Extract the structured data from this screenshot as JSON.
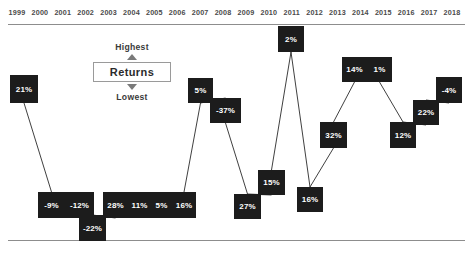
{
  "legend": {
    "highest_label": "Highest",
    "lowest_label": "Lowest",
    "box_label": "Returns",
    "up_arrow": "triangle-up-icon",
    "down_arrow": "triangle-down-icon"
  },
  "chart_data": {
    "type": "line",
    "title": "",
    "subtitle": "",
    "xlabel": "",
    "ylabel": "Returns",
    "grid": false,
    "legend_position": "top-left-inset",
    "axis": {
      "x_tick_labels": [
        "1999",
        "2000",
        "2001",
        "2002",
        "2003",
        "2004",
        "2005",
        "2006",
        "2007",
        "2008",
        "2009",
        "2010",
        "2011",
        "2012",
        "2013",
        "2014",
        "2015",
        "2016",
        "2017",
        "2018"
      ],
      "y_axis_described": "Highest to Lowest",
      "top_rule": true,
      "bottom_rule": true
    },
    "categories": [
      "1999",
      "2000",
      "2001",
      "2002",
      "2003",
      "2004",
      "2005",
      "2006",
      "2007",
      "2008",
      "2009",
      "2010",
      "2011",
      "2012",
      "2013",
      "2014",
      "2015",
      "2016",
      "2017",
      "2018"
    ],
    "values": [
      21,
      -9,
      -12,
      -22,
      28,
      11,
      5,
      16,
      5,
      -37,
      27,
      15,
      2,
      16,
      32,
      14,
      1,
      12,
      22,
      -4
    ],
    "point_labels": [
      "21%",
      "-9%",
      "-12%",
      "-22%",
      "28%",
      "11%",
      "5%",
      "16%",
      "5%",
      "-37%",
      "27%",
      "15%",
      "2%",
      "16%",
      "32%",
      "14%",
      "1%",
      "12%",
      "22%",
      "-4%"
    ],
    "colors": {
      "node_fill": "#1c1c1c",
      "node_text": "#ffffff",
      "connector": "#2a2a2a",
      "rule": "#8d8d8d",
      "year_label": "#4a4a4a"
    }
  },
  "nodes": [
    {
      "year": "1999",
      "label": "21%",
      "x": 10,
      "y": 75,
      "w": 28,
      "h": 28,
      "group": null
    },
    {
      "year": "2000",
      "label": "-9%",
      "x": 38,
      "y": 192,
      "w": 27,
      "h": 26,
      "group": "g2000_2001"
    },
    {
      "year": "2001",
      "label": "-12%",
      "x": 65,
      "y": 192,
      "w": 29,
      "h": 26,
      "group": "g2000_2001"
    },
    {
      "year": "2002",
      "label": "-22%",
      "x": 79,
      "y": 215,
      "w": 27,
      "h": 26,
      "group": null
    },
    {
      "year": "2003",
      "label": "28%",
      "x": 103,
      "y": 192,
      "w": 25,
      "h": 26,
      "group": "g2003_2006"
    },
    {
      "year": "2004",
      "label": "11%",
      "x": 128,
      "y": 192,
      "w": 23,
      "h": 26,
      "group": "g2003_2006"
    },
    {
      "year": "2005",
      "label": "5%",
      "x": 151,
      "y": 192,
      "w": 21,
      "h": 26,
      "group": "g2003_2006"
    },
    {
      "year": "2006",
      "label": "16%",
      "x": 172,
      "y": 192,
      "w": 24,
      "h": 26,
      "group": "g2003_2006"
    },
    {
      "year": "2007",
      "label": "5%",
      "x": 188,
      "y": 78,
      "w": 25,
      "h": 25,
      "group": null
    },
    {
      "year": "2008",
      "label": "-37%",
      "x": 210,
      "y": 98,
      "w": 31,
      "h": 25,
      "group": null
    },
    {
      "year": "2009",
      "label": "27%",
      "x": 234,
      "y": 194,
      "w": 27,
      "h": 25,
      "group": null
    },
    {
      "year": "2010",
      "label": "15%",
      "x": 258,
      "y": 170,
      "w": 27,
      "h": 25,
      "group": null
    },
    {
      "year": "2011",
      "label": "2%",
      "x": 278,
      "y": 26,
      "w": 26,
      "h": 26,
      "group": null
    },
    {
      "year": "2012",
      "label": "16%",
      "x": 297,
      "y": 187,
      "w": 26,
      "h": 25,
      "group": null
    },
    {
      "year": "2013",
      "label": "32%",
      "x": 320,
      "y": 122,
      "w": 27,
      "h": 26,
      "group": null
    },
    {
      "year": "2014",
      "label": "14%",
      "x": 342,
      "y": 57,
      "w": 25,
      "h": 25,
      "group": "g2014_2015"
    },
    {
      "year": "2015",
      "label": "1%",
      "x": 367,
      "y": 57,
      "w": 25,
      "h": 25,
      "group": "g2014_2015"
    },
    {
      "year": "2016",
      "label": "12%",
      "x": 390,
      "y": 122,
      "w": 26,
      "h": 26,
      "group": null
    },
    {
      "year": "2017",
      "label": "22%",
      "x": 413,
      "y": 100,
      "w": 26,
      "h": 25,
      "group": null
    },
    {
      "year": "2018",
      "label": "-4%",
      "x": 436,
      "y": 77,
      "w": 26,
      "h": 26,
      "group": null
    }
  ]
}
